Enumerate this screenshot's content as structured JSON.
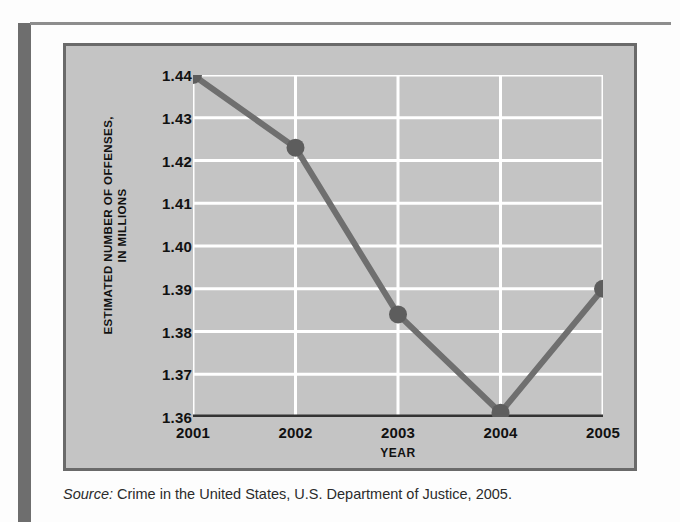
{
  "page": {
    "background_color": "#fdfdfd",
    "left_bar_color": "#6e6e6e",
    "rule_color": "#8d8d8d"
  },
  "chart_panel": {
    "background_color": "#c4c4c4",
    "border_color": "#6a6a6a"
  },
  "source": {
    "label": "Source:",
    "text": "Crime in the United States, U.S. Department of Justice, 2005."
  },
  "chart_data": {
    "type": "line",
    "title": "",
    "xlabel": "YEAR",
    "ylabel": "ESTIMATED NUMBER OF OFFENSES, IN MILLIONS",
    "ylabel_line1": "ESTIMATED NUMBER OF OFFENSES,",
    "ylabel_line2": "IN MILLIONS",
    "categories": [
      "2001",
      "2002",
      "2003",
      "2004",
      "2005"
    ],
    "x": [
      2001,
      2002,
      2003,
      2004,
      2005
    ],
    "values": [
      1.44,
      1.423,
      1.384,
      1.361,
      1.39
    ],
    "ylim": [
      1.36,
      1.44
    ],
    "xlim": [
      2001,
      2005
    ],
    "yticks": [
      "1.44",
      "1.43",
      "1.42",
      "1.41",
      "1.40",
      "1.39",
      "1.38",
      "1.37",
      "1.36"
    ],
    "ytick_values": [
      1.44,
      1.43,
      1.42,
      1.41,
      1.4,
      1.39,
      1.38,
      1.37,
      1.36
    ],
    "xticks": [
      "2001",
      "2002",
      "2003",
      "2004",
      "2005"
    ],
    "grid": true,
    "grid_color": "#ffffff",
    "legend": false,
    "series_color": "#6f6f6f",
    "marker_color": "#5d5d5d",
    "axis_color": "#333333",
    "plot_background": "#c4c4c4"
  }
}
